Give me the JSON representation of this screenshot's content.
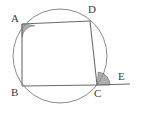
{
  "figure": {
    "background_color": "#ffffff",
    "stroke_color": "#6b6b6b",
    "circle_stroke_color": "#8c8c8c",
    "angle_fill_color": "#8f8f8f",
    "label_color": "#3a3a3a",
    "circle": {
      "center_x": 60,
      "center_y": 56,
      "radius": 47
    },
    "points": {
      "A": {
        "x": 22,
        "y": 24,
        "label": "A",
        "label_x": 11,
        "label_y": 22
      },
      "B": {
        "x": 22,
        "y": 86,
        "label": "B",
        "label_x": 11,
        "label_y": 96
      },
      "C": {
        "x": 97,
        "y": 85,
        "label": "C",
        "label_x": 94,
        "label_y": 97
      },
      "D": {
        "x": 90,
        "y": 21,
        "label": "D",
        "label_x": 88,
        "label_y": 13
      },
      "E": {
        "x": 130,
        "y": 84,
        "label": "E",
        "label_x": 118,
        "label_y": 80
      }
    },
    "segments": [
      {
        "name": "side-AB",
        "from": "A",
        "to": "B"
      },
      {
        "name": "side-BC",
        "from": "B",
        "to": "C"
      },
      {
        "name": "side-CD",
        "from": "C",
        "to": "D"
      },
      {
        "name": "side-DA",
        "from": "D",
        "to": "A"
      },
      {
        "name": "ray-CE",
        "from": "C",
        "to": "E"
      }
    ],
    "marked_angles": [
      {
        "name": "angle-at-A",
        "vertex": "A",
        "description": "interior angle DAB, shaded"
      },
      {
        "name": "angle-at-C",
        "vertex": "C",
        "description": "exterior angle DCE, shaded"
      }
    ]
  }
}
